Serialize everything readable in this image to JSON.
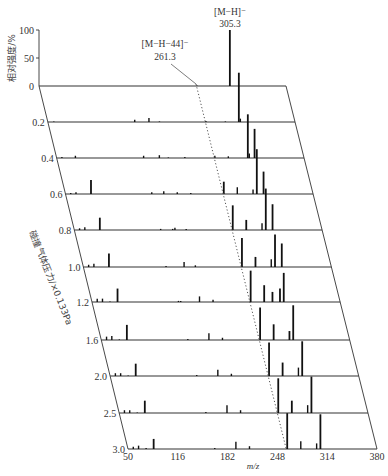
{
  "chart_data": {
    "type": "line",
    "subtype": "3d-waterfall-mass-spectra",
    "title": "",
    "xlabel": "m/z",
    "ylabel": "相对强度/%",
    "zlabel": "碰撞气体压力/×0.133Pa",
    "x_ticks": [
      50,
      116,
      182,
      248,
      314,
      380
    ],
    "xlim": [
      50,
      380
    ],
    "y_ticks": [
      0,
      50,
      100
    ],
    "ylim": [
      0,
      100
    ],
    "z_ticks": [
      "0",
      "0.2",
      "0.4",
      "0.6",
      "0.8",
      "1.0",
      "1.2",
      "1.6",
      "2.0",
      "2.5",
      "3.0"
    ],
    "annotations": [
      {
        "label": "[M−H]⁻",
        "value": "305.3",
        "mz": 305.3
      },
      {
        "label": "[M−H−44]⁻",
        "value": "261.3",
        "mz": 261.3
      }
    ],
    "series": [
      {
        "name": "0",
        "peaks": [
          [
            261,
            1
          ],
          [
            305,
            100
          ]
        ]
      },
      {
        "name": "0.2",
        "peaks": [
          [
            58,
            1
          ],
          [
            166,
            4
          ],
          [
            185,
            7
          ],
          [
            199,
            1
          ],
          [
            261,
            2
          ],
          [
            287,
            1
          ],
          [
            305,
            88
          ],
          [
            307,
            6
          ]
        ]
      },
      {
        "name": "0.4",
        "peaks": [
          [
            57,
            2
          ],
          [
            75,
            4
          ],
          [
            166,
            4
          ],
          [
            187,
            5
          ],
          [
            199,
            1
          ],
          [
            221,
            2
          ],
          [
            261,
            4
          ],
          [
            279,
            3
          ],
          [
            305,
            78
          ],
          [
            307,
            8
          ],
          [
            314,
            52
          ]
        ]
      },
      {
        "name": "0.6",
        "peaks": [
          [
            57,
            2
          ],
          [
            64,
            3
          ],
          [
            84,
            25
          ],
          [
            165,
            3
          ],
          [
            181,
            5
          ],
          [
            199,
            3
          ],
          [
            217,
            2
          ],
          [
            261,
            22
          ],
          [
            279,
            12
          ],
          [
            300,
            8
          ],
          [
            305,
            80
          ],
          [
            314,
            40
          ]
        ]
      },
      {
        "name": "0.8",
        "peaks": [
          [
            57,
            3
          ],
          [
            64,
            5
          ],
          [
            84,
            22
          ],
          [
            165,
            2
          ],
          [
            181,
            2
          ],
          [
            184,
            4
          ],
          [
            199,
            2
          ],
          [
            261,
            44
          ],
          [
            279,
            18
          ],
          [
            300,
            12
          ],
          [
            305,
            74
          ],
          [
            314,
            46
          ]
        ]
      },
      {
        "name": "1.0",
        "peaks": [
          [
            57,
            4
          ],
          [
            64,
            6
          ],
          [
            84,
            24
          ],
          [
            160,
            2
          ],
          [
            184,
            9
          ],
          [
            199,
            3
          ],
          [
            261,
            52
          ],
          [
            279,
            18
          ],
          [
            300,
            14
          ],
          [
            305,
            58
          ],
          [
            314,
            42
          ]
        ]
      },
      {
        "name": "1.2",
        "peaks": [
          [
            57,
            6
          ],
          [
            64,
            6
          ],
          [
            74,
            1
          ],
          [
            84,
            24
          ],
          [
            165,
            2
          ],
          [
            168,
            2
          ],
          [
            193,
            10
          ],
          [
            211,
            4
          ],
          [
            261,
            56
          ],
          [
            279,
            30
          ],
          [
            290,
            18
          ],
          [
            300,
            24
          ],
          [
            305,
            52
          ]
        ]
      },
      {
        "name": "1.6",
        "peaks": [
          [
            57,
            6
          ],
          [
            64,
            7
          ],
          [
            74,
            1
          ],
          [
            84,
            27
          ],
          [
            165,
            2
          ],
          [
            193,
            12
          ],
          [
            211,
            4
          ],
          [
            261,
            58
          ],
          [
            279,
            28
          ],
          [
            300,
            16
          ],
          [
            305,
            62
          ]
        ]
      },
      {
        "name": "2.0",
        "peaks": [
          [
            57,
            5
          ],
          [
            64,
            5
          ],
          [
            74,
            1
          ],
          [
            84,
            22
          ],
          [
            165,
            2
          ],
          [
            193,
            11
          ],
          [
            211,
            4
          ],
          [
            261,
            60
          ],
          [
            279,
            24
          ],
          [
            300,
            15
          ],
          [
            305,
            62
          ]
        ]
      },
      {
        "name": "2.5",
        "peaks": [
          [
            57,
            5
          ],
          [
            64,
            5
          ],
          [
            74,
            1
          ],
          [
            84,
            22
          ],
          [
            165,
            2
          ],
          [
            193,
            14
          ],
          [
            211,
            5
          ],
          [
            261,
            62
          ],
          [
            279,
            22
          ],
          [
            300,
            14
          ],
          [
            305,
            65
          ]
        ]
      },
      {
        "name": "3.0",
        "peaks": [
          [
            57,
            4
          ],
          [
            64,
            6
          ],
          [
            74,
            2
          ],
          [
            84,
            18
          ],
          [
            165,
            2
          ],
          [
            193,
            13
          ],
          [
            211,
            5
          ],
          [
            261,
            64
          ],
          [
            279,
            14
          ],
          [
            300,
            10
          ],
          [
            305,
            62
          ]
        ]
      }
    ],
    "row_baselines_px": [
      86,
      122,
      158,
      194,
      230,
      267,
      302,
      340,
      376,
      413,
      449
    ],
    "legend": "none",
    "grid": false
  },
  "axis": {
    "y_tick_labels": [
      "100",
      "50",
      "0"
    ],
    "x_title": "m/z",
    "y_title": "相对强度/%",
    "z_title": "碰撞气体压力/×0.133Pa"
  },
  "annotations": {
    "mh_label": "[M−H]⁻",
    "mh_value": "305.3",
    "mh44_label": "[M−H−44]⁻",
    "mh44_value": "261.3"
  }
}
